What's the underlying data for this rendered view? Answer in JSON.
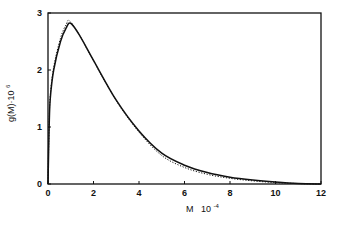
{
  "chart_data": {
    "type": "line",
    "title": "",
    "xlabel": "M 10^-4",
    "ylabel": "g(M)·10^6",
    "xlim": [
      0,
      12
    ],
    "ylim": [
      0,
      3
    ],
    "xticks": [
      0,
      2,
      4,
      6,
      8,
      10,
      12
    ],
    "yticks": [
      0,
      1,
      2,
      3
    ],
    "grid": false,
    "legend": null,
    "series": [
      {
        "name": "solid",
        "style": "solid",
        "x": [
          0,
          0.05,
          0.1,
          0.25,
          0.55,
          0.8,
          1.0,
          1.4,
          2.0,
          3.0,
          4.0,
          5.0,
          6.0,
          7.0,
          8.0,
          9.0,
          10.0,
          11.0,
          12.0
        ],
        "y": [
          0,
          1.0,
          1.5,
          2.0,
          2.5,
          2.74,
          2.82,
          2.6,
          2.17,
          1.47,
          0.93,
          0.54,
          0.33,
          0.2,
          0.12,
          0.07,
          0.035,
          0.01,
          0
        ]
      },
      {
        "name": "dotted",
        "style": "dotted",
        "x": [
          0,
          0.05,
          0.1,
          0.25,
          0.55,
          0.8,
          0.95,
          1.4,
          2.0,
          3.0,
          4.0,
          5.0,
          6.0,
          7.0,
          8.0,
          9.0,
          10.0,
          11.0,
          12.0
        ],
        "y": [
          0,
          1.05,
          1.55,
          2.05,
          2.56,
          2.8,
          2.86,
          2.6,
          2.16,
          1.46,
          0.91,
          0.5,
          0.29,
          0.17,
          0.1,
          0.055,
          0.025,
          0.008,
          0
        ]
      }
    ]
  },
  "axes": {
    "x_title_main": "M",
    "x_title_base": "10",
    "x_title_exp": "-4",
    "y_title_main": "g(M)·10",
    "y_title_exp": "6"
  }
}
